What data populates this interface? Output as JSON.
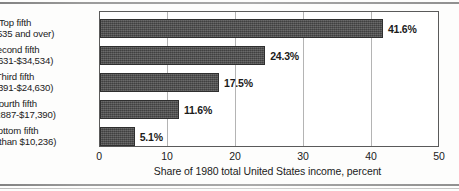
{
  "chart_data": {
    "type": "bar",
    "orientation": "horizontal",
    "title": "",
    "xlabel": "Share of 1980 total United States income, percent",
    "ylabel": "",
    "xlim": [
      0,
      50
    ],
    "xticks": [
      0,
      10,
      20,
      30,
      40,
      50
    ],
    "grid": true,
    "legend": false,
    "categories": [
      "Top fifth ($34,535 and over)",
      "Second fifth ($24,631-$34,534)",
      "Third fifth ($17,391-$24,630)",
      "Fourth fifth ($10,2887-$17,390)",
      "Bottom fifth (Less than $10,236)"
    ],
    "values": [
      41.6,
      24.3,
      17.5,
      11.6,
      5.1
    ],
    "value_labels": [
      "41.6%",
      "24.3%",
      "17.5%",
      "11.6%",
      "5.1%"
    ],
    "bars": [
      {
        "name": "Top fifth",
        "range": "($34,535 and over)",
        "value": 41.6,
        "label": "41.6%"
      },
      {
        "name": "Second fifth",
        "range": "($24,631-$34,534)",
        "value": 24.3,
        "label": "24.3%"
      },
      {
        "name": "Third fifth",
        "range": "($17,391-$24,630)",
        "value": 17.5,
        "label": "17.5%"
      },
      {
        "name": "Fourth fifth",
        "range": "($10,2887-$17,390)",
        "value": 11.6,
        "label": "11.6%"
      },
      {
        "name": "Bottom fifth",
        "range": "(Less than $10,236)",
        "value": 5.1,
        "label": "5.1%"
      }
    ],
    "bar_color": "#4c4c4c",
    "axis_color": "#5a5a5a",
    "grid_color": "#b4b4b4"
  },
  "xticks": [
    {
      "label": "0"
    },
    {
      "label": "10"
    },
    {
      "label": "20"
    },
    {
      "label": "30"
    },
    {
      "label": "40"
    },
    {
      "label": "50"
    }
  ]
}
